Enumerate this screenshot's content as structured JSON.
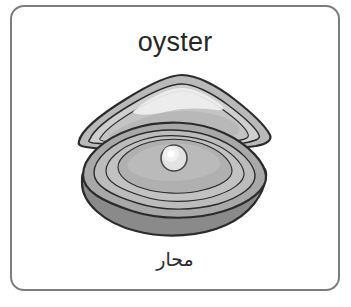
{
  "card": {
    "word_english": "oyster",
    "word_arabic": "محار",
    "border_color": "#7d7d7d",
    "background_color": "#ffffff",
    "text_color": "#262626"
  },
  "illustration": {
    "name": "oyster-with-pearl",
    "description": "Open oyster shell with a pearl inside",
    "colors": {
      "outline": "#2b2b2b",
      "top_shell_outer": "#b9b9b9",
      "top_shell_inner": "#cfcfcf",
      "top_shell_highlight": "#eeeeee",
      "bottom_shell_outer": "#a8a8a8",
      "bottom_shell_inner": "#c2c2c2",
      "bottom_shell_center": "#b0b0b0",
      "bottom_shell_base": "#8a8a8a",
      "pearl": "#e3e3e3",
      "pearl_highlight": "#ffffff"
    }
  }
}
